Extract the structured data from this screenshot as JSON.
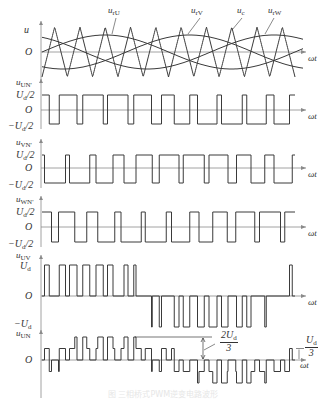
{
  "figure": {
    "axis_x": 41,
    "wave_x0": 42,
    "wave_x1": 295,
    "arrow_x1": 306,
    "stroke": "#3a3a3a",
    "axis_stroke": "#8a8a8a",
    "carrier_periods": 10,
    "modulation_index": 0.68,
    "caption": "图  三相桥式PWM逆变电路波形"
  },
  "panels": [
    {
      "id": "carrier",
      "ylabel": "u",
      "zero_label": "O",
      "xlabel": "ωt",
      "y_top": 27,
      "y_zero": 52,
      "y_bottom": 77,
      "curve_labels": [
        {
          "text": "u",
          "sub": "rU",
          "x": 108,
          "y": 6
        },
        {
          "text": "u",
          "sub": "rV",
          "x": 191,
          "y": 6
        },
        {
          "text": "u",
          "sub": "c",
          "x": 237,
          "y": 6
        },
        {
          "text": "u",
          "sub": "rW",
          "x": 268,
          "y": 6
        }
      ]
    },
    {
      "id": "uUN_prime",
      "ylabel": "u",
      "ylabel_sub": "UN'",
      "levels": {
        "high": "U_d/2",
        "zero": "O",
        "low": "−U_d/2"
      },
      "y_high": 95,
      "y_zero": 110,
      "y_low": 124,
      "phase_deg": 0,
      "xlabel": "ωt"
    },
    {
      "id": "uVN_prime",
      "ylabel": "u",
      "ylabel_sub": "VN'",
      "levels": {
        "high": "U_d/2",
        "zero": "O",
        "low": "−U_d/2"
      },
      "y_high": 155,
      "y_zero": 168,
      "y_low": 183,
      "phase_deg": -120,
      "xlabel": "ωt"
    },
    {
      "id": "uWN_prime",
      "ylabel": "u",
      "ylabel_sub": "WN'",
      "levels": {
        "high": "U_d/2",
        "zero": "O",
        "low": "−U_d/2"
      },
      "y_high": 212,
      "y_zero": 227,
      "y_low": 242,
      "phase_deg": 120,
      "xlabel": "ωt"
    },
    {
      "id": "uUV",
      "ylabel": "u",
      "ylabel_sub": "UV",
      "levels": {
        "high": "U_d",
        "zero": "O",
        "low": "−U_d"
      },
      "y_high": 265,
      "y_zero": 296,
      "y_low": 327,
      "xlabel": "ωt"
    },
    {
      "id": "uUN",
      "ylabel": "u",
      "ylabel_sub": "UN",
      "zero_label": "O",
      "y_zero": 360,
      "step_px": 11.5,
      "xlabel": "ωt",
      "annotations": {
        "two_thirds": {
          "num": "2U",
          "num_sub": "d",
          "den": "3"
        },
        "one_third": {
          "num": "U",
          "num_sub": "d",
          "den": "3"
        }
      }
    }
  ],
  "chart_data": {
    "type": "line",
    "x": "ωt",
    "series": [
      {
        "name": "u_c (triangular carrier)",
        "periods": 10,
        "amplitude": 1
      },
      {
        "name": "u_rU",
        "amplitude": 0.68,
        "phase_deg": 0
      },
      {
        "name": "u_rV",
        "amplitude": 0.68,
        "phase_deg": -120
      },
      {
        "name": "u_rW",
        "amplitude": 0.68,
        "phase_deg": 120
      },
      {
        "name": "u_UN'",
        "levels": [
          "U_d/2",
          "-U_d/2"
        ]
      },
      {
        "name": "u_VN'",
        "levels": [
          "U_d/2",
          "-U_d/2"
        ]
      },
      {
        "name": "u_WN'",
        "levels": [
          "U_d/2",
          "-U_d/2"
        ]
      },
      {
        "name": "u_UV",
        "levels": [
          "U_d",
          "0",
          "-U_d"
        ]
      },
      {
        "name": "u_UN",
        "levels": [
          "2U_d/3",
          "U_d/3",
          "0",
          "-U_d/3",
          "-2U_d/3"
        ]
      }
    ]
  }
}
